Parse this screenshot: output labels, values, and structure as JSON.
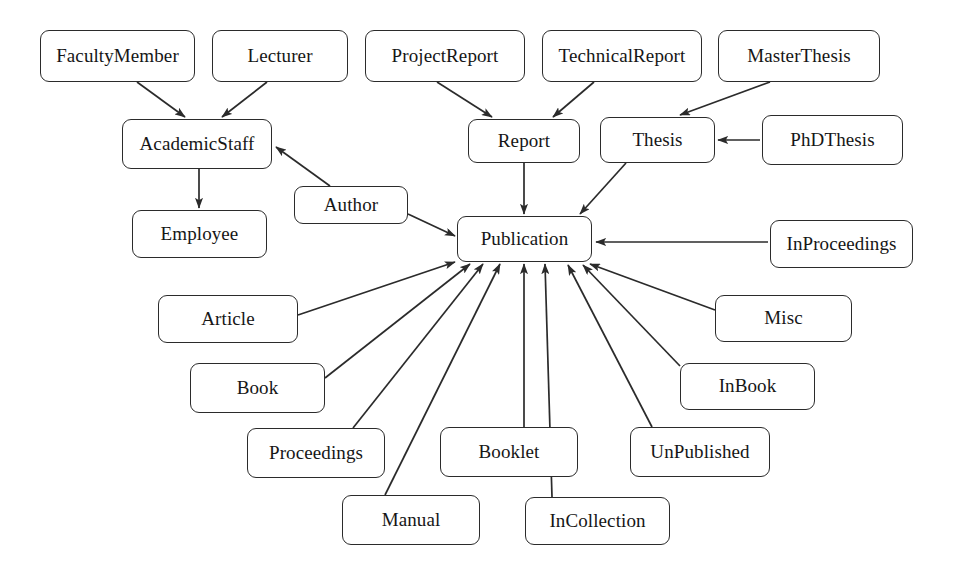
{
  "diagram": {
    "type": "class-hierarchy-graph",
    "style": {
      "background": "#ffffff",
      "node_fill": "#ffffff",
      "node_stroke": "#2b2b2b",
      "edge_stroke": "#2b2b2b",
      "text_color": "#161616"
    },
    "nodes": [
      {
        "id": "FacultyMember",
        "label": "FacultyMember",
        "x": 40,
        "y": 30,
        "w": 155,
        "h": 52,
        "font": 19
      },
      {
        "id": "Lecturer",
        "label": "Lecturer",
        "x": 212,
        "y": 30,
        "w": 136,
        "h": 52,
        "font": 19
      },
      {
        "id": "ProjectReport",
        "label": "ProjectReport",
        "x": 365,
        "y": 30,
        "w": 160,
        "h": 52,
        "font": 19
      },
      {
        "id": "TechnicalReport",
        "label": "TechnicalReport",
        "x": 542,
        "y": 30,
        "w": 160,
        "h": 52,
        "font": 19
      },
      {
        "id": "MasterThesis",
        "label": "MasterThesis",
        "x": 718,
        "y": 30,
        "w": 162,
        "h": 52,
        "font": 19
      },
      {
        "id": "AcademicStaff",
        "label": "AcademicStaff",
        "x": 122,
        "y": 119,
        "w": 150,
        "h": 50,
        "font": 19
      },
      {
        "id": "Report",
        "label": "Report",
        "x": 468,
        "y": 119,
        "w": 112,
        "h": 44,
        "font": 19
      },
      {
        "id": "Thesis",
        "label": "Thesis",
        "x": 600,
        "y": 117,
        "w": 115,
        "h": 46,
        "font": 19
      },
      {
        "id": "PhDThesis",
        "label": "PhDThesis",
        "x": 762,
        "y": 115,
        "w": 141,
        "h": 50,
        "font": 19
      },
      {
        "id": "Author",
        "label": "Author",
        "x": 294,
        "y": 186,
        "w": 114,
        "h": 38,
        "font": 19
      },
      {
        "id": "Employee",
        "label": "Employee",
        "x": 132,
        "y": 210,
        "w": 135,
        "h": 48,
        "font": 19
      },
      {
        "id": "Publication",
        "label": "Publication",
        "x": 457,
        "y": 216,
        "w": 135,
        "h": 46,
        "font": 19
      },
      {
        "id": "InProceedings",
        "label": "InProceedings",
        "x": 770,
        "y": 220,
        "w": 143,
        "h": 48,
        "font": 19
      },
      {
        "id": "Article",
        "label": "Article",
        "x": 158,
        "y": 295,
        "w": 140,
        "h": 48,
        "font": 19
      },
      {
        "id": "Misc",
        "label": "Misc",
        "x": 715,
        "y": 295,
        "w": 137,
        "h": 47,
        "font": 19
      },
      {
        "id": "Book",
        "label": "Book",
        "x": 190,
        "y": 363,
        "w": 135,
        "h": 50,
        "font": 19
      },
      {
        "id": "InBook",
        "label": "InBook",
        "x": 680,
        "y": 363,
        "w": 135,
        "h": 47,
        "font": 19
      },
      {
        "id": "Proceedings",
        "label": "Proceedings",
        "x": 247,
        "y": 428,
        "w": 138,
        "h": 50,
        "font": 19
      },
      {
        "id": "Booklet",
        "label": "Booklet",
        "x": 440,
        "y": 427,
        "w": 138,
        "h": 50,
        "font": 19
      },
      {
        "id": "UnPublished",
        "label": "UnPublished",
        "x": 630,
        "y": 427,
        "w": 140,
        "h": 50,
        "font": 19
      },
      {
        "id": "Manual",
        "label": "Manual",
        "x": 342,
        "y": 495,
        "w": 138,
        "h": 50,
        "font": 19
      },
      {
        "id": "InCollection",
        "label": "InCollection",
        "x": 525,
        "y": 497,
        "w": 145,
        "h": 48,
        "font": 19
      }
    ],
    "edges": [
      {
        "from": "FacultyMember",
        "to": "AcademicStaff",
        "x1": 137,
        "y1": 82,
        "x2": 185,
        "y2": 117,
        "arrow": true
      },
      {
        "from": "Lecturer",
        "to": "AcademicStaff",
        "x1": 267,
        "y1": 82,
        "x2": 222,
        "y2": 117,
        "arrow": true
      },
      {
        "from": "AcademicStaff",
        "to": "Employee",
        "x1": 199,
        "y1": 169,
        "x2": 199,
        "y2": 208,
        "arrow": true
      },
      {
        "from": "ProjectReport",
        "to": "Report",
        "x1": 437,
        "y1": 82,
        "x2": 492,
        "y2": 117,
        "arrow": true
      },
      {
        "from": "TechnicalReport",
        "to": "Report",
        "x1": 594,
        "y1": 82,
        "x2": 553,
        "y2": 117,
        "arrow": true
      },
      {
        "from": "MasterThesis",
        "to": "Thesis",
        "x1": 770,
        "y1": 82,
        "x2": 680,
        "y2": 115,
        "arrow": true
      },
      {
        "from": "PhDThesis",
        "to": "Thesis",
        "x1": 760,
        "y1": 140,
        "x2": 718,
        "y2": 140,
        "arrow": true
      },
      {
        "from": "Report",
        "to": "Publication",
        "x1": 524,
        "y1": 163,
        "x2": 524,
        "y2": 214,
        "arrow": true
      },
      {
        "from": "Thesis",
        "to": "Publication",
        "x1": 626,
        "y1": 163,
        "x2": 580,
        "y2": 214,
        "arrow": true
      },
      {
        "from": "Author",
        "to": "Publication",
        "x1": 408,
        "y1": 214,
        "x2": 455,
        "y2": 236,
        "arrow": true
      },
      {
        "from": "Author",
        "to": "AcademicStaff",
        "x1": 330,
        "y1": 186,
        "x2": 276,
        "y2": 147,
        "arrow": true
      },
      {
        "from": "InProceedings",
        "to": "Publication",
        "x1": 768,
        "y1": 242,
        "x2": 596,
        "y2": 242,
        "arrow": true
      },
      {
        "from": "Article",
        "to": "Publication",
        "x1": 298,
        "y1": 315,
        "x2": 455,
        "y2": 262,
        "arrow": true
      },
      {
        "from": "Misc",
        "to": "Publication",
        "x1": 715,
        "y1": 310,
        "x2": 590,
        "y2": 264,
        "arrow": true
      },
      {
        "from": "Book",
        "to": "Publication",
        "x1": 325,
        "y1": 378,
        "x2": 470,
        "y2": 264,
        "arrow": true
      },
      {
        "from": "InBook",
        "to": "Publication",
        "x1": 680,
        "y1": 366,
        "x2": 583,
        "y2": 265,
        "arrow": true
      },
      {
        "from": "Proceedings",
        "to": "Publication",
        "x1": 353,
        "y1": 428,
        "x2": 483,
        "y2": 264,
        "arrow": true
      },
      {
        "from": "Booklet",
        "to": "Publication",
        "x1": 524,
        "y1": 427,
        "x2": 524,
        "y2": 264,
        "arrow": true
      },
      {
        "from": "UnPublished",
        "to": "Publication",
        "x1": 652,
        "y1": 427,
        "x2": 568,
        "y2": 265,
        "arrow": true
      },
      {
        "from": "Manual",
        "to": "Publication",
        "x1": 385,
        "y1": 495,
        "x2": 500,
        "y2": 264,
        "arrow": true
      },
      {
        "from": "InCollection",
        "to": "Publication",
        "x1": 552,
        "y1": 497,
        "x2": 545,
        "y2": 264,
        "arrow": true
      }
    ]
  }
}
